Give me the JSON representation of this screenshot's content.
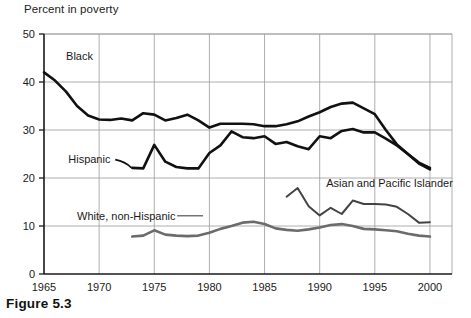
{
  "figure": {
    "caption": "Figure 5.3",
    "axis_title": "Percent in poverty"
  },
  "chart_data": {
    "type": "line",
    "title": "Percent in poverty",
    "xlabel": "",
    "ylabel": "Percent in poverty",
    "xlim": [
      1965,
      2002
    ],
    "ylim": [
      0,
      50
    ],
    "xticks": [
      1965,
      1970,
      1975,
      1980,
      1985,
      1990,
      1995,
      2000
    ],
    "xtick_labels": [
      "1965",
      "1970",
      "1975",
      "1980",
      "1985",
      "1990",
      "1995",
      "2000"
    ],
    "yticks": [
      0,
      10,
      20,
      30,
      40,
      50
    ],
    "ytick_labels": [
      "0",
      "10",
      "20",
      "30",
      "40",
      "50"
    ],
    "grid": true,
    "legend": "inline-annotations",
    "series": [
      {
        "name": "Black",
        "color": "#111111",
        "width": 2.6,
        "label_x": 1967.0,
        "label_y": 44.5,
        "x": [
          1965,
          1966,
          1967,
          1968,
          1969,
          1970,
          1971,
          1972,
          1973,
          1974,
          1975,
          1976,
          1977,
          1978,
          1979,
          1980,
          1981,
          1982,
          1983,
          1984,
          1985,
          1986,
          1987,
          1988,
          1989,
          1990,
          1991,
          1992,
          1993,
          1994,
          1995,
          1996,
          1997,
          1998,
          1999,
          2000
        ],
        "y": [
          42.0,
          40.3,
          38.0,
          35.0,
          33.0,
          32.2,
          32.1,
          32.4,
          32.0,
          33.5,
          33.2,
          32.0,
          32.5,
          33.2,
          32.0,
          30.5,
          31.3,
          31.3,
          31.3,
          31.2,
          30.8,
          30.8,
          31.2,
          31.8,
          32.8,
          33.7,
          34.8,
          35.5,
          35.7,
          34.5,
          33.3,
          30.0,
          27.0,
          25.0,
          23.2,
          22.1
        ]
      },
      {
        "name": "Hispanic",
        "color": "#111111",
        "width": 2.6,
        "label_x": 1967.2,
        "label_y": 23.2,
        "x": [
          1973,
          1974,
          1975,
          1976,
          1977,
          1978,
          1979,
          1980,
          1981,
          1982,
          1983,
          1984,
          1985,
          1986,
          1987,
          1988,
          1989,
          1990,
          1991,
          1992,
          1993,
          1994,
          1995,
          1996,
          1997,
          1998,
          1999,
          2000
        ],
        "y": [
          22.1,
          22.0,
          26.9,
          23.4,
          22.3,
          22.0,
          22.0,
          25.2,
          26.8,
          29.7,
          28.5,
          28.3,
          28.7,
          27.1,
          27.5,
          26.6,
          26.0,
          28.7,
          28.3,
          29.8,
          30.2,
          29.5,
          29.5,
          28.2,
          26.8,
          25.0,
          23.0,
          21.8
        ]
      },
      {
        "name": "Asian and Pacific Islander",
        "color": "#444444",
        "width": 2.0,
        "label_x": 1990.6,
        "label_y": 18.2,
        "x": [
          1987,
          1988,
          1989,
          1990,
          1991,
          1992,
          1993,
          1994,
          1995,
          1996,
          1997,
          1998,
          1999,
          2000
        ],
        "y": [
          16.1,
          17.9,
          14.1,
          12.2,
          13.8,
          12.5,
          15.3,
          14.6,
          14.6,
          14.5,
          14.0,
          12.5,
          10.7,
          10.8
        ]
      },
      {
        "name": "White, non-Hispanic",
        "color": "#6b6b6b",
        "width": 2.6,
        "label_x": 1968.0,
        "label_y": 11.3,
        "x": [
          1973,
          1974,
          1975,
          1976,
          1977,
          1978,
          1979,
          1980,
          1981,
          1982,
          1983,
          1984,
          1985,
          1986,
          1987,
          1988,
          1989,
          1990,
          1991,
          1992,
          1993,
          1994,
          1995,
          1996,
          1997,
          1998,
          1999,
          2000
        ],
        "y": [
          7.8,
          8.0,
          9.1,
          8.2,
          8.0,
          7.9,
          8.0,
          8.6,
          9.4,
          10.0,
          10.7,
          10.9,
          10.4,
          9.5,
          9.2,
          9.0,
          9.3,
          9.7,
          10.2,
          10.4,
          10.0,
          9.4,
          9.3,
          9.1,
          8.9,
          8.4,
          8.0,
          7.8
        ]
      }
    ]
  }
}
